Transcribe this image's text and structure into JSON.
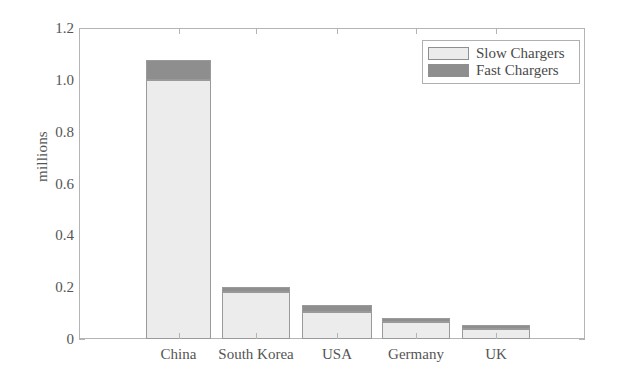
{
  "chart_data": {
    "type": "bar",
    "subtype": "stacked-vertical",
    "title": "",
    "xlabel": "",
    "ylabel": "millions",
    "ylim": [
      0,
      1.2
    ],
    "yticks": [
      "0",
      "0.2",
      "0.4",
      "0.6",
      "0.8",
      "1.0",
      "1.2"
    ],
    "ytick_values": [
      0,
      0.2,
      0.4,
      0.6,
      0.8,
      1.0,
      1.2
    ],
    "grid": false,
    "legend_position": "top-right",
    "categories": [
      "China",
      "South Korea",
      "USA",
      "Germany",
      "UK"
    ],
    "series": [
      {
        "name": "Slow Chargers",
        "color": "#ececec",
        "values": [
          1.0,
          0.181,
          0.104,
          0.066,
          0.039
        ]
      },
      {
        "name": "Fast Chargers",
        "color": "#8e8e8e",
        "values": [
          0.077,
          0.02,
          0.027,
          0.015,
          0.015
        ]
      }
    ],
    "totals": [
      1.077,
      0.201,
      0.131,
      0.081,
      0.054
    ]
  },
  "legend": {
    "items": [
      {
        "label": "Slow Chargers",
        "swatch": "slow"
      },
      {
        "label": "Fast Chargers",
        "swatch": "fast"
      }
    ]
  },
  "axes": {
    "y_label": "millions"
  }
}
